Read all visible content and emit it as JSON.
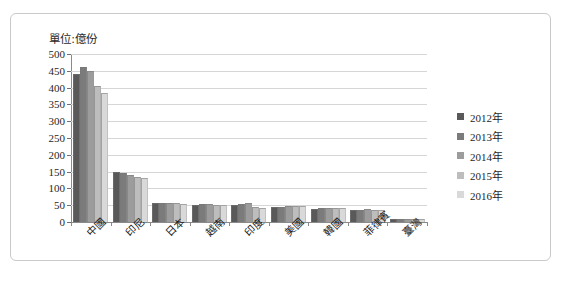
{
  "unit_label": "單位:億份",
  "legend": {
    "position": "right",
    "entries": [
      {
        "label": "2012年",
        "color": "#595959"
      },
      {
        "label": "2013年",
        "color": "#7b7b7b"
      },
      {
        "label": "2014年",
        "color": "#9c9c9c"
      },
      {
        "label": "2015年",
        "color": "#bdbdbd"
      },
      {
        "label": "2016年",
        "color": "#d9d9d9"
      }
    ]
  },
  "chart_data": {
    "type": "bar",
    "title": "單位:億份",
    "xlabel": "",
    "ylabel": "億份",
    "ylim": [
      0,
      500
    ],
    "yticks": [
      0,
      50,
      100,
      150,
      200,
      250,
      300,
      350,
      400,
      450,
      500
    ],
    "ytick_labels": [
      "0",
      "50",
      "100",
      "150",
      "200",
      "250",
      "300",
      "350",
      "400",
      "450",
      "500"
    ],
    "grid": true,
    "legend_position": "right",
    "categories": [
      "中國",
      "印尼",
      "日本",
      "越南",
      "印度",
      "美國",
      "韓國",
      "菲律賓",
      "臺灣"
    ],
    "series": [
      {
        "name": "2012年",
        "color": "#595959",
        "values": [
          440,
          148,
          56,
          52,
          50,
          45,
          40,
          36,
          8
        ]
      },
      {
        "name": "2013年",
        "color": "#7b7b7b",
        "values": [
          460,
          145,
          57,
          53,
          54,
          46,
          42,
          37,
          9
        ]
      },
      {
        "name": "2014年",
        "color": "#9c9c9c",
        "values": [
          450,
          140,
          57,
          53,
          58,
          47,
          43,
          38,
          9
        ]
      },
      {
        "name": "2015年",
        "color": "#bdbdbd",
        "values": [
          405,
          133,
          56,
          52,
          44,
          47,
          43,
          37,
          9
        ]
      },
      {
        "name": "2016年",
        "color": "#d9d9d9",
        "values": [
          385,
          130,
          55,
          51,
          42,
          47,
          43,
          36,
          8
        ]
      }
    ]
  }
}
